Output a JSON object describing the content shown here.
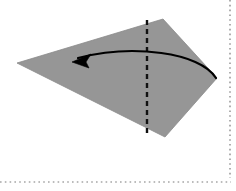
{
  "figure": {
    "canvas": {
      "width": 236,
      "height": 191,
      "background": "#ffffff"
    },
    "paper": {
      "name": "folded paper shape",
      "fill": "#969696",
      "stroke": "#8a8a8a",
      "outline_points": "17,63 163,19 217,78 165,137",
      "vertices": [
        {
          "label": "left point",
          "x": 17,
          "y": 63
        },
        {
          "label": "top point",
          "x": 163,
          "y": 19
        },
        {
          "label": "right point",
          "x": 217,
          "y": 78
        },
        {
          "label": "bottom point",
          "x": 165,
          "y": 137
        }
      ]
    },
    "fold_line": {
      "name": "vertical valley fold crease",
      "style": "dashed",
      "color": "#111111",
      "width": 2.4,
      "dash_pattern": "5,4",
      "x1": 147,
      "y1": 20,
      "x2": 147,
      "y2": 136
    },
    "fold_arrow": {
      "name": "curved fold direction arrow",
      "color": "#000000",
      "width": 2.2,
      "direction": "right-to-left",
      "path": "M 216,78 C 200,52 132,44 78,58",
      "head_tip": {
        "x": 72,
        "y": 62
      },
      "head_points": "72,62 91,54 86,62 89,68"
    },
    "borders": {
      "name": "page guide dotted rules",
      "color": "#7a7a7a",
      "dash_pattern": "1.6,3.2",
      "width": 1.2,
      "right": {
        "x": 230,
        "y1": 0,
        "y2": 178
      },
      "bottom": {
        "y": 182,
        "x1": 0,
        "x2": 231
      }
    }
  }
}
